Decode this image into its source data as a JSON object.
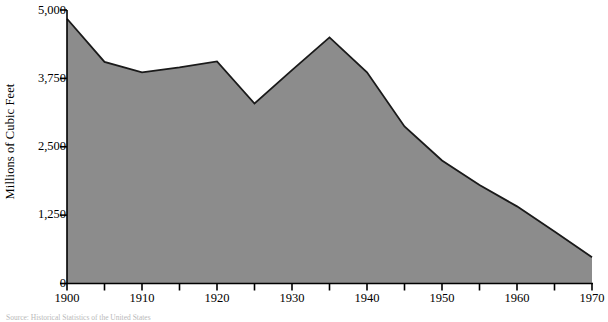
{
  "chart_data": {
    "type": "area",
    "title": "",
    "xlabel": "",
    "ylabel": "Millions of Cubic Feet",
    "x": [
      1900,
      1905,
      1910,
      1915,
      1920,
      1925,
      1930,
      1935,
      1940,
      1945,
      1950,
      1955,
      1960,
      1965,
      1970
    ],
    "values": [
      4840,
      4050,
      3860,
      3950,
      4060,
      3290,
      3900,
      4500,
      3860,
      2870,
      2250,
      1800,
      1410,
      950,
      480
    ],
    "series": [
      {
        "name": "Millions of Cubic Feet",
        "values": [
          4840,
          4050,
          3860,
          3950,
          4060,
          3290,
          3900,
          4500,
          3860,
          2870,
          2250,
          1800,
          1410,
          950,
          480
        ]
      }
    ],
    "xlim": [
      1900,
      1970
    ],
    "ylim": [
      0,
      5000
    ],
    "x_tick_labels": [
      "1900",
      "1910",
      "1920",
      "1930",
      "1940",
      "1950",
      "1960",
      "1970"
    ],
    "x_tick_values": [
      1900,
      1910,
      1920,
      1930,
      1940,
      1950,
      1960,
      1970
    ],
    "x_minor_tick_values": [
      1905,
      1915,
      1925,
      1935,
      1945,
      1955,
      1965
    ],
    "y_tick_labels": [
      "0",
      "1,250",
      "2,500",
      "3,750",
      "5,000"
    ],
    "y_tick_values": [
      0,
      1250,
      2500,
      3750,
      5000
    ],
    "grid": false,
    "legend": false,
    "legend_position": "none",
    "area_fill_color": "#8c8c8c",
    "line_color": "#1a1a1a",
    "axis_color": "#000000",
    "background_color": "#ffffff"
  },
  "axes": {
    "y_title": "Millions of Cubic Feet",
    "y_ticks": [
      {
        "label": "5,000",
        "value": 5000
      },
      {
        "label": "3,750",
        "value": 3750
      },
      {
        "label": "2,500",
        "value": 2500
      },
      {
        "label": "1,250",
        "value": 1250
      },
      {
        "label": "0",
        "value": 0
      }
    ],
    "x_ticks": [
      {
        "label": "1900",
        "value": 1900
      },
      {
        "label": "1910",
        "value": 1910
      },
      {
        "label": "1920",
        "value": 1920
      },
      {
        "label": "1930",
        "value": 1930
      },
      {
        "label": "1940",
        "value": 1940
      },
      {
        "label": "1950",
        "value": 1950
      },
      {
        "label": "1960",
        "value": 1960
      },
      {
        "label": "1970",
        "value": 1970
      }
    ]
  },
  "footer": {
    "source_note": "Source: Historical Statistics of the United States"
  }
}
